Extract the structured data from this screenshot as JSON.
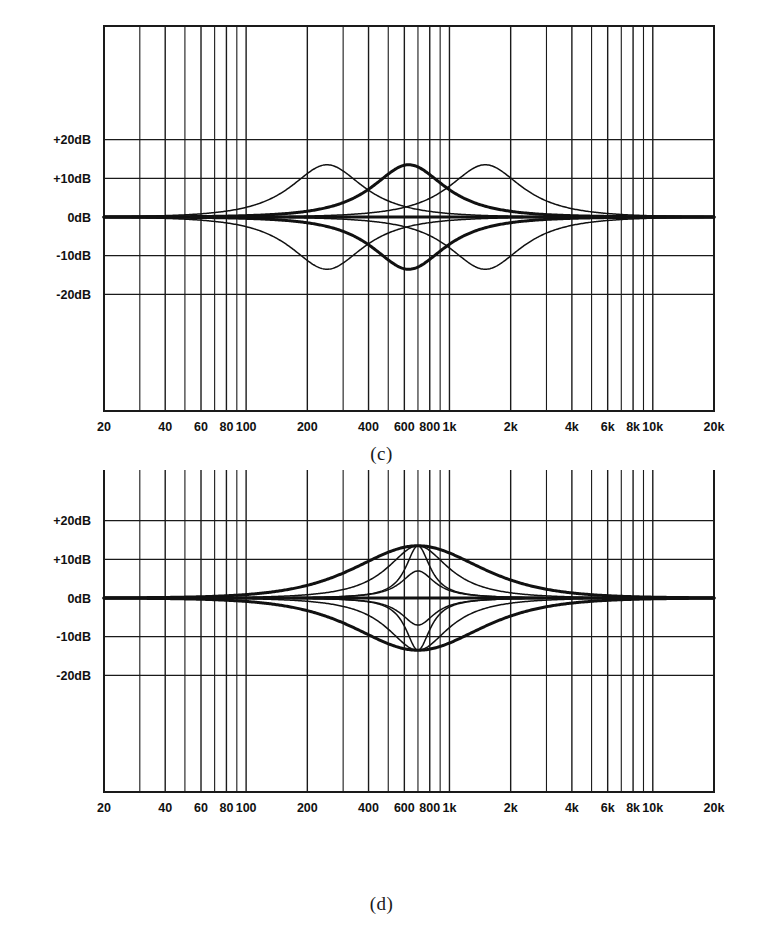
{
  "figure": {
    "panels": [
      {
        "id": "c",
        "caption": "(c)"
      },
      {
        "id": "d",
        "caption": "(d)"
      }
    ],
    "footer_text": ""
  },
  "axes": {
    "y_ticks": [
      {
        "value": 20,
        "label": "+20dB"
      },
      {
        "value": 10,
        "label": "+10dB"
      },
      {
        "value": 0,
        "label": "0dB"
      },
      {
        "value": -10,
        "label": "-10dB"
      },
      {
        "value": -20,
        "label": "-20dB"
      }
    ],
    "x_ticks": [
      {
        "value": 20,
        "label": "20"
      },
      {
        "value": 40,
        "label": "40"
      },
      {
        "value": 60,
        "label": "60"
      },
      {
        "value": 80,
        "label": "80"
      },
      {
        "value": 100,
        "label": "100"
      },
      {
        "value": 200,
        "label": "200"
      },
      {
        "value": 400,
        "label": "400"
      },
      {
        "value": 600,
        "label": "600"
      },
      {
        "value": 800,
        "label": "800"
      },
      {
        "value": 1000,
        "label": "1k"
      },
      {
        "value": 2000,
        "label": "2k"
      },
      {
        "value": 4000,
        "label": "4k"
      },
      {
        "value": 6000,
        "label": "6k"
      },
      {
        "value": 8000,
        "label": "8k"
      },
      {
        "value": 10000,
        "label": "10k"
      },
      {
        "value": 20000,
        "label": "20k"
      }
    ],
    "x_minor_gridlines": [
      30,
      50,
      70,
      90,
      300,
      500,
      700,
      900,
      3000,
      5000,
      7000,
      9000
    ],
    "y_minor_gridlines": [
      25,
      15,
      5,
      -5,
      -15,
      -25
    ],
    "xlim": [
      20,
      20000
    ],
    "ylim": [
      -27,
      27
    ],
    "grid": true,
    "log_x": true
  },
  "style": {
    "line_color": "#111111",
    "grid_color": "#1a1a1a",
    "background": "#ffffff",
    "thin_width": 1.5,
    "thick_width": 3.0
  },
  "chart_data": [
    {
      "type": "line",
      "id": "c",
      "title": "(c)",
      "subtitle": "Parametric EQ response — three sweepable centre frequencies, boost and cut",
      "xlabel": "Frequency (Hz)",
      "ylabel": "Level (dB)",
      "xlim": [
        20,
        20000
      ],
      "ylim": [
        -27,
        27
      ],
      "xscale": "log",
      "grid": true,
      "legend": "none",
      "x_ticks": [
        "20",
        "40",
        "60",
        "80",
        "100",
        "200",
        "400",
        "600",
        "800",
        "1k",
        "2k",
        "4k",
        "6k",
        "8k",
        "10k",
        "20k"
      ],
      "y_ticks": [
        "+20dB",
        "+10dB",
        "0dB",
        "-10dB",
        "-20dB"
      ],
      "series": [
        {
          "name": "low-band boost",
          "center_hz": 250,
          "gain_db": 13.5,
          "q": 1.0,
          "weight": "thin"
        },
        {
          "name": "low-band cut",
          "center_hz": 250,
          "gain_db": -13.5,
          "q": 1.0,
          "weight": "thin"
        },
        {
          "name": "mid-band boost",
          "center_hz": 630,
          "gain_db": 13.5,
          "q": 1.0,
          "weight": "thick"
        },
        {
          "name": "mid-band cut",
          "center_hz": 630,
          "gain_db": -13.5,
          "q": 1.0,
          "weight": "thick"
        },
        {
          "name": "high-band boost",
          "center_hz": 1500,
          "gain_db": 13.5,
          "q": 1.0,
          "weight": "thin"
        },
        {
          "name": "high-band cut",
          "center_hz": 1500,
          "gain_db": -13.5,
          "q": 1.0,
          "weight": "thin"
        },
        {
          "name": "flat reference",
          "center_hz": 630,
          "gain_db": 0.0,
          "q": 1.0,
          "weight": "thick"
        }
      ],
      "annotations": [
        "Peaks reach about +13.5 dB; dips reach about -13.5 dB",
        "All curves return to 0 dB at 20 Hz and 20 kHz"
      ]
    },
    {
      "type": "line",
      "id": "d",
      "title": "(d)",
      "subtitle": "Parametric EQ response — fixed centre frequency with variable Q / bandwidth",
      "xlabel": "Frequency (Hz)",
      "ylabel": "Level (dB)",
      "xlim": [
        20,
        20000
      ],
      "ylim": [
        -27,
        27
      ],
      "xscale": "log",
      "grid": true,
      "legend": "none",
      "x_ticks": [
        "20",
        "40",
        "60",
        "80",
        "100",
        "200",
        "400",
        "600",
        "800",
        "1k",
        "2k",
        "4k",
        "6k",
        "8k",
        "10k",
        "20k"
      ],
      "y_ticks": [
        "+20dB",
        "+10dB",
        "0dB",
        "-10dB",
        "-20dB"
      ],
      "series": [
        {
          "name": "wide-Q boost",
          "center_hz": 700,
          "gain_db": 13.5,
          "q": 0.55,
          "weight": "thick"
        },
        {
          "name": "wide-Q cut",
          "center_hz": 700,
          "gain_db": -13.5,
          "q": 0.55,
          "weight": "thick"
        },
        {
          "name": "medium-Q boost",
          "center_hz": 700,
          "gain_db": 13.5,
          "q": 1.2,
          "weight": "thin"
        },
        {
          "name": "medium-Q cut",
          "center_hz": 700,
          "gain_db": -13.5,
          "q": 1.2,
          "weight": "thin"
        },
        {
          "name": "narrow-Q boost",
          "center_hz": 700,
          "gain_db": 13.5,
          "q": 3.0,
          "weight": "thin"
        },
        {
          "name": "narrow-Q cut",
          "center_hz": 700,
          "gain_db": -13.5,
          "q": 3.0,
          "weight": "thin"
        },
        {
          "name": "narrow low-gain boost",
          "center_hz": 700,
          "gain_db": 7.0,
          "q": 2.2,
          "weight": "thin"
        },
        {
          "name": "narrow low-gain cut",
          "center_hz": 700,
          "gain_db": -7.0,
          "q": 2.2,
          "weight": "thin"
        },
        {
          "name": "flat reference",
          "center_hz": 700,
          "gain_db": 0.0,
          "q": 1.0,
          "weight": "thick"
        }
      ],
      "annotations": [
        "All bands centred near 700 Hz",
        "Peak levels about +13.5 dB and +7 dB; dips about -13.5 dB and -7 dB"
      ]
    }
  ]
}
